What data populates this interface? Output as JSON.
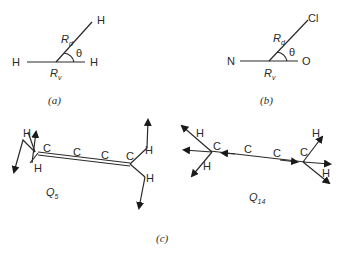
{
  "panel_a": {
    "atoms": {
      "left": "H",
      "right": "H",
      "top": "H"
    },
    "labels": {
      "rd": "R",
      "rd_sub": "d",
      "rv": "R",
      "rv_sub": "v",
      "angle": "θ"
    },
    "caption": "(a)"
  },
  "panel_b": {
    "atoms": {
      "left": "N",
      "right": "O",
      "top": "Cl"
    },
    "labels": {
      "rd": "R",
      "rd_sub": "d",
      "rv": "R",
      "rv_sub": "v",
      "angle": "θ"
    },
    "caption": "(b)"
  },
  "panel_c": {
    "q5": {
      "label": "Q",
      "sub": "5",
      "atoms": [
        "H",
        "H",
        "C",
        "C",
        "C",
        "C",
        "H",
        "H"
      ]
    },
    "q14": {
      "label": "Q",
      "sub": "14",
      "atoms": [
        "H",
        "H",
        "C",
        "C",
        "C",
        "C",
        "H",
        "H"
      ]
    },
    "caption": "(c)"
  }
}
